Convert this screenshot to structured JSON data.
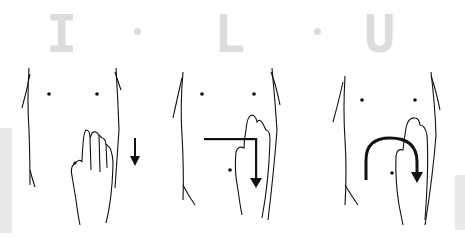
{
  "header": {
    "letters": [
      "I",
      "L",
      "U"
    ],
    "letter_color": "#dcdcdc"
  },
  "panels": [
    {
      "label": "I",
      "stroke": "downward straight stroke on left side of abdomen",
      "hand_position": "lower left abdomen",
      "arrow": "down"
    },
    {
      "label": "L",
      "stroke": "horizontal stroke across abdomen then downward",
      "hand_position": "left abdomen",
      "arrow": "L-shape"
    },
    {
      "label": "U",
      "stroke": "curved stroke across abdomen then downward",
      "hand_position": "left abdomen",
      "arrow": "inverted-U"
    }
  ],
  "colors": {
    "ink": "#111111",
    "background": "#ffffff"
  }
}
